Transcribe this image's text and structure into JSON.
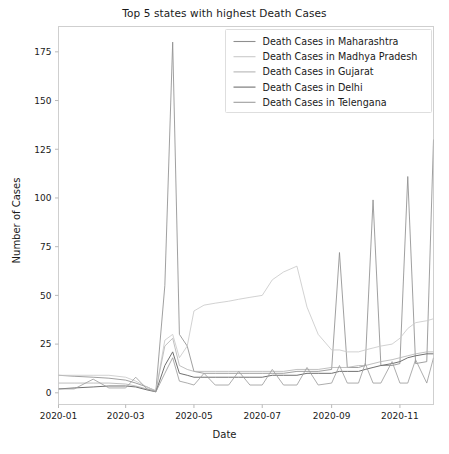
{
  "chart_data": {
    "type": "line",
    "title": "Top 5 states with highest Death Cases",
    "xlabel": "Date",
    "ylabel": "Number of Cases",
    "grid": false,
    "legend_position": "upper right",
    "xlim": [
      "2020-01-01",
      "2020-12-01"
    ],
    "ylim": [
      -6,
      188
    ],
    "yticks": [
      0,
      25,
      50,
      75,
      100,
      125,
      150,
      175
    ],
    "xticks": [
      "2020-01",
      "2020-03",
      "2020-05",
      "2020-07",
      "2020-09",
      "2020-11"
    ],
    "x": [
      "2020-01-01",
      "2020-01-15",
      "2020-02-01",
      "2020-02-15",
      "2020-03-01",
      "2020-03-10",
      "2020-03-20",
      "2020-03-28",
      "2020-04-05",
      "2020-04-12",
      "2020-04-18",
      "2020-04-25",
      "2020-05-01",
      "2020-05-10",
      "2020-05-20",
      "2020-06-01",
      "2020-06-10",
      "2020-06-20",
      "2020-07-01",
      "2020-07-10",
      "2020-07-20",
      "2020-08-01",
      "2020-08-10",
      "2020-08-20",
      "2020-09-01",
      "2020-09-08",
      "2020-09-15",
      "2020-09-25",
      "2020-10-01",
      "2020-10-08",
      "2020-10-15",
      "2020-10-25",
      "2020-11-01",
      "2020-11-08",
      "2020-11-15",
      "2020-11-25",
      "2020-12-01"
    ],
    "series": [
      {
        "name": "Death Cases in Maharashtra",
        "color": "#8f8f8f",
        "linewidth": 0.85,
        "values": [
          9,
          8.5,
          8,
          7.5,
          6.5,
          5,
          3,
          1,
          55,
          180,
          30,
          24,
          11,
          10,
          10,
          10,
          10,
          10,
          10,
          10,
          10,
          11,
          11,
          11,
          12,
          72,
          13,
          13,
          14,
          99,
          14,
          14,
          15,
          111,
          15,
          16,
          130
        ]
      },
      {
        "name": "Death Cases in Madhya Pradesh",
        "color": "#cacaca",
        "linewidth": 0.85,
        "values": [
          9,
          9,
          9,
          9,
          8,
          6,
          3,
          1,
          27,
          30,
          18,
          24,
          42,
          45,
          46,
          47,
          48,
          49,
          50,
          58,
          62,
          65,
          44,
          30,
          22,
          22,
          21,
          21,
          22,
          23,
          24,
          25,
          28,
          33,
          36,
          37,
          38
        ]
      },
      {
        "name": "Death Cases in Gujarat",
        "color": "#b5b5b5",
        "linewidth": 0.85,
        "values": [
          5,
          5,
          5,
          5,
          4.5,
          3.5,
          2,
          1,
          24,
          28,
          14,
          12,
          11,
          11,
          11,
          11,
          11,
          11,
          11,
          11,
          11,
          12,
          12,
          12,
          13,
          13,
          13,
          14,
          14,
          15,
          16,
          17,
          18,
          19,
          20,
          21,
          21
        ]
      },
      {
        "name": "Death Cases in Delhi",
        "color": "#707070",
        "linewidth": 1.0,
        "values": [
          2,
          2.5,
          3,
          3.5,
          3.5,
          3,
          1.5,
          0.5,
          14,
          21,
          10,
          9,
          8,
          8,
          8,
          8,
          8,
          8,
          8,
          9,
          9,
          9,
          10,
          10,
          10,
          11,
          11,
          11,
          12,
          13,
          14,
          15,
          16,
          18,
          19,
          20,
          20
        ]
      },
      {
        "name": "Death Cases in Telengana",
        "color": "#9e9e9e",
        "linewidth": 0.85,
        "values": [
          2,
          2,
          7,
          2.5,
          2.5,
          8,
          2,
          0.5,
          10,
          18,
          6,
          5,
          4,
          10,
          4,
          4,
          11,
          4,
          4,
          12,
          4,
          4,
          13,
          4,
          5,
          14,
          5,
          5,
          15,
          5,
          5,
          16,
          5,
          5,
          17,
          5,
          18
        ]
      }
    ]
  }
}
